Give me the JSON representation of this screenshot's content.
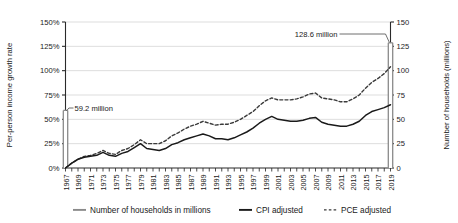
{
  "chart_data": {
    "type": "line",
    "title": "",
    "xlabel": "",
    "ylabel": "Per-person income growth rate",
    "y2label": "Number of households (millions)",
    "ylim": [
      0,
      150
    ],
    "y2lim": [
      0,
      150
    ],
    "ytick_labels": [
      "150%",
      "125%",
      "100%",
      "75%",
      "50%",
      "25%",
      "0%"
    ],
    "ytick_values": [
      150,
      125,
      100,
      75,
      50,
      25,
      0
    ],
    "y2tick_labels": [
      "150",
      "125",
      "100",
      "75",
      "50",
      "25",
      "0"
    ],
    "y2tick_values": [
      150,
      125,
      100,
      75,
      50,
      25,
      0
    ],
    "grid": true,
    "legend_position": "bottom",
    "x": [
      1967,
      1968,
      1969,
      1970,
      1971,
      1972,
      1973,
      1974,
      1975,
      1976,
      1977,
      1978,
      1979,
      1980,
      1981,
      1982,
      1983,
      1984,
      1985,
      1986,
      1987,
      1988,
      1989,
      1990,
      1991,
      1992,
      1993,
      1994,
      1995,
      1996,
      1997,
      1998,
      1999,
      2000,
      2001,
      2002,
      2003,
      2004,
      2005,
      2006,
      2007,
      2008,
      2009,
      2010,
      2011,
      2012,
      2013,
      2014,
      2015,
      2016,
      2017,
      2018,
      2019
    ],
    "xtick_labels": [
      "1967",
      "1969",
      "1971",
      "1973",
      "1975",
      "1977",
      "1979",
      "1981",
      "1983",
      "1985",
      "1987",
      "1989",
      "1991",
      "1993",
      "1995",
      "1997",
      "1999",
      "2001",
      "2003",
      "2005",
      "2007",
      "2009",
      "2011",
      "2013",
      "2015",
      "2017",
      "2019"
    ],
    "series": [
      {
        "name": "CPI adjusted",
        "style": "solid",
        "color": "#1a1a1a",
        "axis": "left",
        "values": [
          0,
          5,
          9,
          11,
          12,
          13,
          16,
          13,
          12,
          15,
          17,
          21,
          25,
          20,
          19,
          18,
          20,
          24,
          26,
          29,
          31,
          33,
          35,
          33,
          30,
          30,
          29,
          31,
          34,
          37,
          41,
          46,
          50,
          53,
          50,
          49,
          48,
          48,
          49,
          51,
          52,
          47,
          45,
          44,
          43,
          43,
          45,
          48,
          54,
          58,
          60,
          62,
          65
        ]
      },
      {
        "name": "PCE adjusted",
        "style": "dashed",
        "color": "#3a3a3a",
        "axis": "left",
        "values": [
          0,
          5,
          9,
          12,
          13,
          15,
          18,
          15,
          14,
          18,
          20,
          24,
          29,
          25,
          25,
          25,
          28,
          33,
          36,
          40,
          43,
          45,
          48,
          46,
          44,
          45,
          45,
          47,
          50,
          54,
          58,
          64,
          69,
          72,
          70,
          70,
          70,
          71,
          73,
          76,
          77,
          72,
          71,
          70,
          68,
          68,
          71,
          75,
          82,
          88,
          92,
          97,
          104
        ]
      },
      {
        "name": "Number of households in millions",
        "style": "bar-marker",
        "color": "#8a8a8a",
        "axis": "right",
        "points": [
          {
            "x": 1967,
            "value": 59.2,
            "label": "59.2 million"
          },
          {
            "x": 2019,
            "value": 128.6,
            "label": "128.6 million"
          }
        ]
      }
    ],
    "annotations": [
      {
        "text": "59.2 million",
        "x": 1967,
        "value": 59.2
      },
      {
        "text": "128.6 million",
        "x": 2019,
        "value": 128.6
      }
    ],
    "legend": [
      {
        "label": "Number of households in millions",
        "style": "solid",
        "color": "#8a8a8a"
      },
      {
        "label": "CPI adjusted",
        "style": "solid",
        "color": "#1a1a1a"
      },
      {
        "label": "PCE adjusted",
        "style": "dashed",
        "color": "#3a3a3a"
      }
    ]
  }
}
